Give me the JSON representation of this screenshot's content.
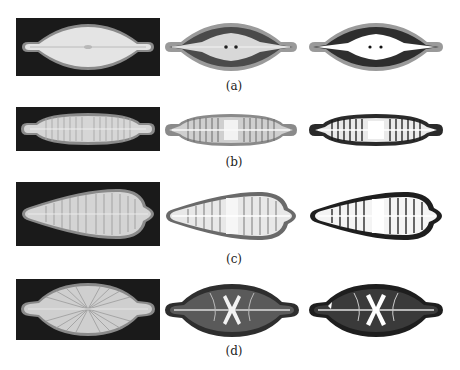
{
  "figure": {
    "rows": [
      {
        "label": "(a)",
        "shape": "lanceolate-capitate",
        "panels": [
          "original",
          "segmentation-gray",
          "segmentation-bw"
        ]
      },
      {
        "label": "(b)",
        "shape": "linear-capitate-striate",
        "panels": [
          "original",
          "segmentation-gray",
          "segmentation-bw"
        ]
      },
      {
        "label": "(c)",
        "shape": "clavate-striate",
        "panels": [
          "original",
          "segmentation-gray",
          "segmentation-bw"
        ]
      },
      {
        "label": "(d)",
        "shape": "elliptic-capitate-radiate",
        "panels": [
          "original",
          "segmentation-gray",
          "segmentation-bw"
        ]
      }
    ]
  },
  "colors": {
    "background": "#ffffff",
    "panel_dark": "#1a1a1a",
    "valve_light": "#dcdcdc",
    "valve_mid": "#8a8a8a",
    "valve_dark": "#3a3a3a"
  }
}
